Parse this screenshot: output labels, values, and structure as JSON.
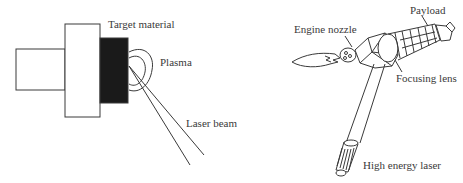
{
  "left_diagram": {
    "labels": {
      "target_material": "Target material",
      "plasma": "Plasma",
      "laser_beam": "Laser beam"
    }
  },
  "right_diagram": {
    "labels": {
      "payload": "Payload",
      "engine_nozzle": "Engine nozzle",
      "focusing_lens": "Focusing lens",
      "high_energy_laser": "High energy laser"
    }
  },
  "colors": {
    "line": "#3a3a3a",
    "target_fill": "#1a1a1a",
    "background": "#ffffff"
  }
}
